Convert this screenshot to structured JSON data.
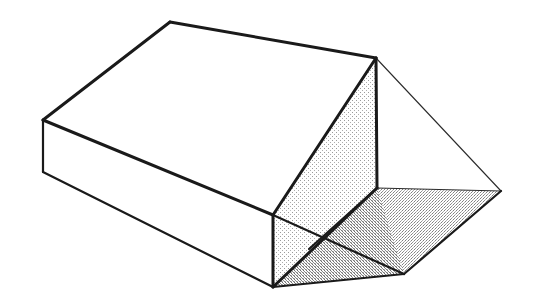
{
  "figure": {
    "title": "Isometric line drawing of a rectangular box with an attached triangular wedge / prism roof form",
    "background_color": "#ffffff",
    "stroke_color": "#1a1a1a",
    "thin_stroke_color": "#2b2b2b",
    "canvas": {
      "width": 535,
      "height": 304
    },
    "fills": {
      "white": "#ffffff",
      "light_stipple": "#eeeeee",
      "mid_stipple": "#e0e0e0",
      "dark_stipple": "#d6d6d6"
    },
    "stroke_widths": {
      "heavy": 3.0,
      "medium": 2.2,
      "thin": 1.1
    },
    "vertices": {
      "box_top_back_left": [
        170,
        22
      ],
      "box_top_front_left": [
        43,
        120
      ],
      "box_bottom_front_left": [
        43,
        172
      ],
      "ridge_apex": [
        376,
        58
      ],
      "box_front_bottom": [
        273,
        287
      ],
      "box_front_mid": [
        273,
        215
      ],
      "wedge_right_tip": [
        501,
        191
      ],
      "wedge_mid_junction": [
        377,
        188
      ],
      "wedge_lower_right": [
        404,
        274
      ],
      "stipple_cross_point": [
        309,
        249
      ]
    },
    "faces": [
      {
        "name": "box-top-face",
        "fill": "white",
        "points": "170,22 376,58 273,215 43,120"
      },
      {
        "name": "box-left-end-face",
        "fill": "white",
        "points": "43,120 273,215 273,287 43,172"
      },
      {
        "name": "wedge-upper-triangle-face",
        "fill": "light_stipple",
        "points": "376,58 377,188 273,215"
      },
      {
        "name": "wedge-lower-triangle-face",
        "fill": "light_stipple",
        "points": "273,215 377,188 273,287"
      },
      {
        "name": "wedge-right-upper-face",
        "fill": "mid_stipple",
        "points": "377,188 501,191 404,274"
      },
      {
        "name": "wedge-right-lower-face",
        "fill": "dark_stipple",
        "points": "273,287 377,188 404,274"
      }
    ],
    "edges": [
      {
        "name": "box-top-back-edge",
        "weight": "heavy",
        "path": "170,22 376,58"
      },
      {
        "name": "box-top-left-edge",
        "weight": "heavy",
        "path": "170,22 43,120"
      },
      {
        "name": "box-left-vertical-edge",
        "weight": "medium",
        "path": "43,120 43,172"
      },
      {
        "name": "box-bottom-left-edge",
        "weight": "medium",
        "path": "43,172 273,287"
      },
      {
        "name": "box-top-front-edge",
        "weight": "heavy",
        "path": "43,120 273,215"
      },
      {
        "name": "box-front-vertical-edge",
        "weight": "heavy",
        "path": "273,215 273,287"
      },
      {
        "name": "ridge-diagonal-edge",
        "weight": "heavy",
        "path": "376,58 273,215"
      },
      {
        "name": "ridge-vertical-edge",
        "weight": "heavy",
        "path": "376,58 377,188"
      },
      {
        "name": "wedge-hip-edge-to-bottom",
        "weight": "heavy",
        "path": "377,188 273,287"
      },
      {
        "name": "wedge-right-tip-upper-edge",
        "weight": "thin",
        "path": "376,58 501,191"
      },
      {
        "name": "wedge-right-tip-mid-edge",
        "weight": "thin",
        "path": "377,188 501,191"
      },
      {
        "name": "wedge-right-tip-lower-edge",
        "weight": "medium",
        "path": "501,191 404,274"
      },
      {
        "name": "wedge-bottom-right-edge",
        "weight": "medium",
        "path": "404,274 273,287"
      },
      {
        "name": "wedge-hip-crease-edge",
        "weight": "medium",
        "path": "377,188 309,249"
      },
      {
        "name": "wedge-inner-crease-edge",
        "weight": "medium",
        "path": "273,215 404,274"
      }
    ]
  }
}
